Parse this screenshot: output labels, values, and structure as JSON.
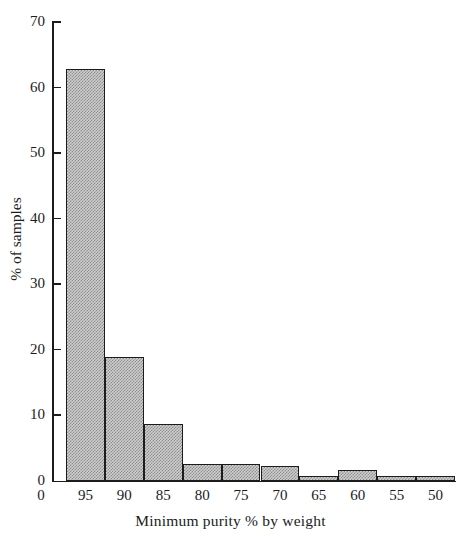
{
  "chart_data": {
    "type": "bar",
    "title": "",
    "subtitle": "",
    "xlabel": "Minimum purity % by weight",
    "ylabel": "% of samples",
    "categories": [
      "95",
      "90",
      "85",
      "80",
      "75",
      "70",
      "65",
      "60",
      "55",
      "50"
    ],
    "values": [
      63,
      19,
      8.7,
      2.7,
      2.7,
      2.3,
      0.8,
      1.8,
      0.8,
      0.8
    ],
    "ylim": [
      0,
      70
    ],
    "yticks": [
      0,
      10,
      20,
      30,
      40,
      50,
      60,
      70
    ],
    "ytick_labels": [
      "0",
      "10",
      "20",
      "30",
      "40",
      "50",
      "60",
      "70"
    ],
    "xtick_labels": [
      "95",
      "90",
      "85",
      "80",
      "75",
      "70",
      "65",
      "60",
      "55",
      "50"
    ],
    "origin_label": "0",
    "grid": false,
    "legend": false,
    "legend_position": "none",
    "bar_fill_color": "#cfcfcf",
    "bar_edge_color": "#1c1c1c",
    "axis_color": "#1c1c1c"
  }
}
